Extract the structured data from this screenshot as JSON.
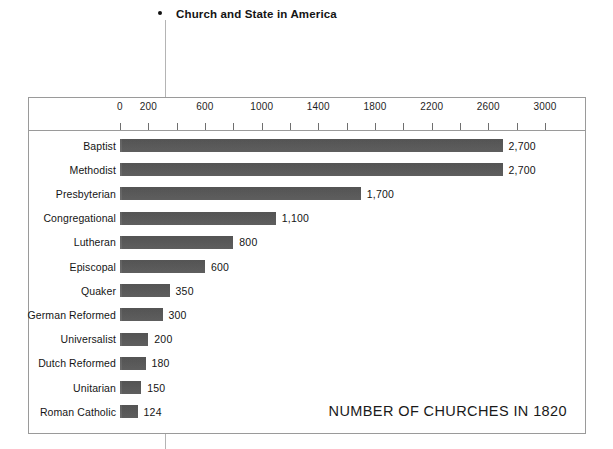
{
  "slide": {
    "bullet_glyph": "bullet-dot",
    "heading": "Church and State in America"
  },
  "chart_data": {
    "type": "bar",
    "orientation": "horizontal",
    "title": "",
    "caption": "NUMBER OF CHURCHES IN 1820",
    "xlabel": "",
    "ylabel": "",
    "xlim": [
      0,
      3100
    ],
    "axis_max_tick": 3000,
    "tick_interval": 200,
    "ticks": [
      0,
      200,
      400,
      600,
      800,
      1000,
      1200,
      1400,
      1600,
      1800,
      2000,
      2200,
      2400,
      2600,
      2800,
      3000
    ],
    "tick_labels": [
      "0",
      "200",
      "",
      "600",
      "",
      "1000",
      "",
      "1400",
      "",
      "1800",
      "",
      "2200",
      "",
      "2600",
      "",
      "3000"
    ],
    "grid": false,
    "legend": false,
    "bar_color": "#5d5d5d",
    "categories": [
      "Baptist",
      "Methodist",
      "Presbyterian",
      "Congregational",
      "Lutheran",
      "Episcopal",
      "Quaker",
      "German Reformed",
      "Universalist",
      "Dutch Reformed",
      "Unitarian",
      "Roman Catholic"
    ],
    "values": [
      2700,
      2700,
      1700,
      1100,
      800,
      600,
      350,
      300,
      200,
      180,
      150,
      124
    ],
    "value_labels": [
      "2,700",
      "2,700",
      "1,700",
      "1,100",
      "800",
      "600",
      "350",
      "300",
      "200",
      "180",
      "150",
      "124"
    ]
  }
}
